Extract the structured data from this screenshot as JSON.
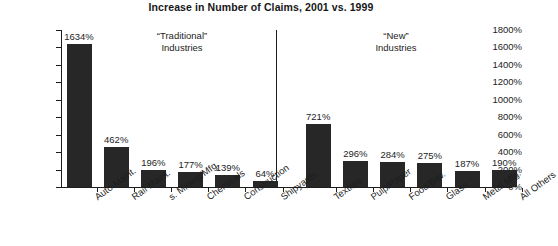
{
  "chart_data": {
    "type": "bar",
    "title": "Increase in Number of Claims, 2001 vs. 1999",
    "xlabel": "",
    "ylabel": "",
    "ylim": [
      0,
      1800
    ],
    "ytick_labels": [
      "1800%",
      "1600%",
      "1400%",
      "1200%",
      "1000%",
      "800%",
      "600%",
      "400%",
      "200%",
      "0%"
    ],
    "ytick_values": [
      1800,
      1600,
      1400,
      1200,
      1000,
      800,
      600,
      400,
      200,
      0
    ],
    "grid": false,
    "legend": "none",
    "categories": [
      "Auto Maint.",
      "Rail Maint.",
      "s. Mining/Mfg.",
      "Chemicals",
      "Construction",
      "Shipyards",
      "Textiles",
      "Pulp/Paper",
      "Food/Bev.",
      "Glass",
      "Metal Mfg.",
      "All Others"
    ],
    "values": [
      1634,
      462,
      196,
      177,
      139,
      64,
      721,
      296,
      284,
      275,
      187,
      190
    ],
    "value_labels": [
      "1634%",
      "462%",
      "196%",
      "177%",
      "139%",
      "64%",
      "721%",
      "296%",
      "284%",
      "275%",
      "187%",
      "190%"
    ],
    "groups": [
      {
        "caption_line1": "“Traditional”",
        "caption_line2": "Industries",
        "category_indices": [
          0,
          1,
          2,
          3,
          4,
          5
        ]
      },
      {
        "caption_line1": "“New”",
        "caption_line2": "Industries",
        "category_indices": [
          6,
          7,
          8,
          9,
          10,
          11
        ]
      }
    ],
    "bar_color": "#272727",
    "axis_color": "#1d1d1d",
    "background_color": "#ffffff"
  }
}
